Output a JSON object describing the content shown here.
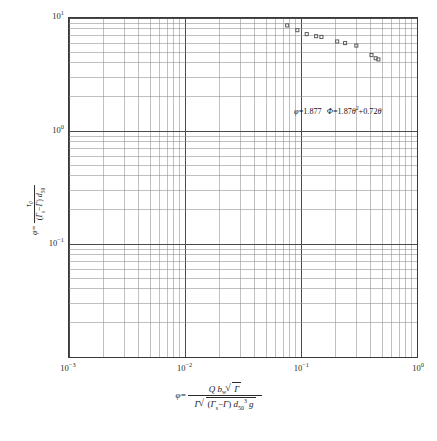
{
  "chart_data": {
    "type": "scatter",
    "title": "",
    "xlabel": "phi = Q bw sqrt(Gamma) / ( Gamma sqrt( (Gamma_s - Gamma) d50^3 g ) )",
    "ylabel": "tau_0 / ( (Gamma_s - Gamma) d50 )",
    "xscale": "log",
    "yscale": "log",
    "xlim": [
      0.001,
      1
    ],
    "ylim": [
      0.01,
      10
    ],
    "y_axis_inverted": true,
    "grid": true,
    "minor_grid": true,
    "legend": "none",
    "xticks": [
      "10⁻³",
      "10⁻²",
      "10⁻¹",
      "10⁰"
    ],
    "xtick_values": [
      0.001,
      0.01,
      0.1,
      1
    ],
    "yticks": [
      "10⁻¹",
      "10⁰",
      "10¹",
      "10²"
    ],
    "ytick_values": [
      0.1,
      1,
      10,
      100
    ],
    "points": [
      {
        "x": 0.00108,
        "y": 64.0
      },
      {
        "x": 0.00135,
        "y": 52.0
      },
      {
        "x": 0.0019,
        "y": 44.0
      },
      {
        "x": 0.00255,
        "y": 38.5
      },
      {
        "x": 0.0032,
        "y": 37.5
      },
      {
        "x": 0.0061,
        "y": 33.0
      },
      {
        "x": 0.0069,
        "y": 32.0
      },
      {
        "x": 0.009,
        "y": 28.5
      },
      {
        "x": 0.01,
        "y": 27.0
      },
      {
        "x": 0.0108,
        "y": 25.0
      },
      {
        "x": 0.0114,
        "y": 24.0
      },
      {
        "x": 0.0123,
        "y": 23.5
      },
      {
        "x": 0.017,
        "y": 20.5
      },
      {
        "x": 0.025,
        "y": 15.5
      },
      {
        "x": 0.042,
        "y": 11.5
      },
      {
        "x": 0.076,
        "y": 8.6
      },
      {
        "x": 0.093,
        "y": 7.8
      },
      {
        "x": 0.112,
        "y": 7.2
      },
      {
        "x": 0.135,
        "y": 6.9
      },
      {
        "x": 0.15,
        "y": 6.8
      },
      {
        "x": 0.205,
        "y": 6.2
      },
      {
        "x": 0.24,
        "y": 6.0
      },
      {
        "x": 0.3,
        "y": 5.7
      },
      {
        "x": 0.405,
        "y": 4.7
      },
      {
        "x": 0.44,
        "y": 4.4
      },
      {
        "x": 0.465,
        "y": 4.3
      }
    ],
    "annotations": [
      {
        "text_plain": "φ=1.877   Φ=1.87θ²+0.72θ",
        "x": 0.085,
        "y": 1.45
      }
    ]
  },
  "yaxis": {
    "ticks": [
      {
        "label_mantissa": "10",
        "label_exponent": "−1"
      },
      {
        "label_mantissa": "10",
        "label_exponent": "0"
      },
      {
        "label_mantissa": "10",
        "label_exponent": "1"
      },
      {
        "label_mantissa": "10",
        "label_exponent": "2"
      }
    ],
    "title": {
      "phi_symbol": "φ",
      "equals": "=",
      "numerator": "τ₀",
      "denominator_open": "(",
      "denominator_gs": "Γ",
      "denominator_gs_sub": "s",
      "denominator_minus": "−",
      "denominator_g": "Γ",
      "denominator_close": ")",
      "denominator_d": "d",
      "denominator_d_sub": "50"
    }
  },
  "xaxis": {
    "ticks": [
      {
        "label_mantissa": "10",
        "label_exponent": "−3"
      },
      {
        "label_mantissa": "10",
        "label_exponent": "−2"
      },
      {
        "label_mantissa": "10",
        "label_exponent": "−1"
      },
      {
        "label_mantissa": "10",
        "label_exponent": "0"
      }
    ],
    "title": {
      "phi_symbol": "φ",
      "equals": "=",
      "num_Q": "Q",
      "num_b": "b",
      "num_b_sub": "w",
      "num_sqrt_inner": "Γ",
      "den_lead_gamma": "Γ",
      "den_open": "(",
      "den_gs": "Γ",
      "den_gs_sub": "s",
      "den_minus": "−",
      "den_g": "Γ",
      "den_close": ")",
      "den_d": "d",
      "den_d_sub": "50",
      "den_d_sup": "3",
      "den_g_grav": "g"
    }
  },
  "annotation": {
    "phi_lower": "φ",
    "eq1": "=1.877",
    "phi_upper": "Φ",
    "eq2": "=1.87",
    "theta1": "θ",
    "theta1_sup": "2",
    "plus": "+0.72",
    "theta2": "θ"
  },
  "caption": {
    "text": ""
  },
  "colors": {
    "major_grid": "#4a4a4a",
    "minor_grid": "#8c8c8c",
    "frame": "#3a3a3a",
    "marker_stroke": "#555555",
    "text": "#1a1a1a",
    "background": "#ffffff"
  }
}
